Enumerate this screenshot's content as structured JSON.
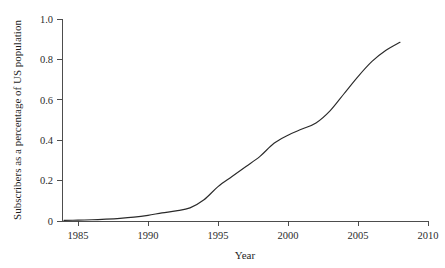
{
  "chart_data": {
    "type": "line",
    "title": "",
    "xlabel": "Year",
    "ylabel": "Subscribers as a percentage of US population",
    "xlim": [
      1983.6,
      2010.4
    ],
    "ylim": [
      0.0,
      1.0
    ],
    "grid": false,
    "legend": false,
    "legend_position": "none",
    "line_color": "#2a2a2a",
    "background_color": "#ffffff",
    "axis_color": "#3a3a3a",
    "xticks": [
      1985,
      1990,
      1995,
      2000,
      2005,
      2010
    ],
    "xtick_labels": [
      "1985",
      "1990",
      "1995",
      "2000",
      "2005",
      "2010"
    ],
    "yticks": [
      0,
      0.2,
      0.4,
      0.6,
      0.8,
      1.0
    ],
    "ytick_labels": [
      "0",
      "0.2",
      "0.4",
      "0.6",
      "0.8",
      "1.0"
    ],
    "series": [
      {
        "name": "Subscribers as a percentage of US population",
        "x": [
          1984,
          1985,
          1986,
          1987,
          1988,
          1989,
          1990,
          1991,
          1992,
          1993,
          1994,
          1995,
          1996,
          1997,
          1998,
          1999,
          2000,
          2001,
          2002,
          2003,
          2004,
          2005,
          2006,
          2007,
          2008
        ],
        "values": [
          0.003,
          0.004,
          0.006,
          0.009,
          0.013,
          0.019,
          0.028,
          0.04,
          0.05,
          0.065,
          0.105,
          0.17,
          0.22,
          0.27,
          0.32,
          0.385,
          0.425,
          0.455,
          0.485,
          0.545,
          0.63,
          0.715,
          0.79,
          0.845,
          0.885
        ]
      }
    ]
  }
}
